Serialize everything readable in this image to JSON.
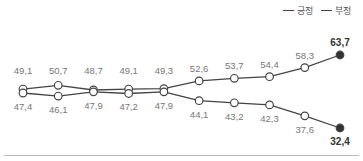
{
  "chart_data": {
    "type": "line",
    "title": "",
    "xlabel": "",
    "ylabel": "",
    "categories": [
      "1",
      "2",
      "3",
      "4",
      "5",
      "6",
      "7",
      "8",
      "9",
      "10"
    ],
    "series": [
      {
        "name": "긍정",
        "values": [
          49.1,
          50.7,
          48.7,
          49.1,
          49.3,
          52.6,
          53.7,
          54.4,
          58.3,
          63.7
        ],
        "labels": [
          "49,1",
          "50,7",
          "48,7",
          "49,1",
          "49,3",
          "52,6",
          "53,7",
          "54,4",
          "58,3",
          "63,7"
        ],
        "label_position": "above"
      },
      {
        "name": "부정",
        "values": [
          47.4,
          46.1,
          47.9,
          47.2,
          47.9,
          44.1,
          43.2,
          42.3,
          37.6,
          32.4
        ],
        "labels": [
          "47,4",
          "46,1",
          "47,9",
          "47,2",
          "47,9",
          "44,1",
          "43,2",
          "42,3",
          "37,6",
          "32,4"
        ],
        "label_position": "below"
      }
    ],
    "grid": false,
    "legend_position": "top-right",
    "colors": {
      "line": "#444444",
      "marker_fill": "#ffffff",
      "last_marker_fill": "#333333",
      "label": "#777777",
      "last_label": "#333333"
    }
  },
  "legend": {
    "items": [
      {
        "label": "긍정"
      },
      {
        "label": "부정"
      }
    ]
  }
}
